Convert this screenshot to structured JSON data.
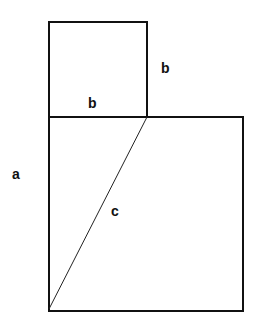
{
  "diagram": {
    "title": "",
    "shapes": {
      "small_square": {
        "x": 49,
        "y": 22,
        "w": 98,
        "h": 95
      },
      "large_square": {
        "x": 49,
        "y": 117,
        "w": 194,
        "h": 194
      },
      "diagonal": {
        "x1": 147,
        "y1": 117,
        "x2": 49,
        "y2": 309
      }
    },
    "labels": {
      "b_right": "b",
      "b_bottom": "b",
      "a": "a",
      "c": "c"
    },
    "colors": {
      "stroke": "#111111",
      "background": "#ffffff"
    }
  }
}
